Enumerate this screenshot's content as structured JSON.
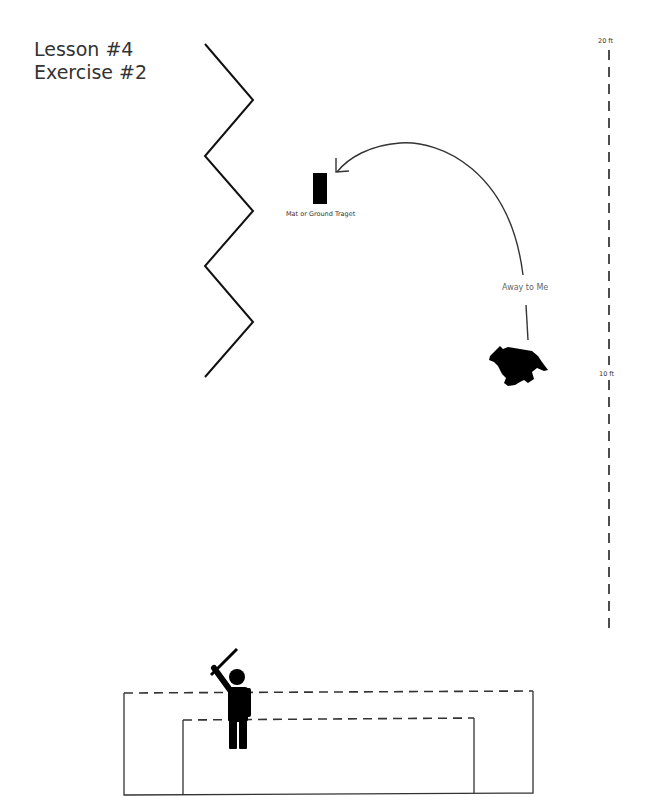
{
  "title": {
    "line1": "Lesson #4",
    "line2": "Exercise #2"
  },
  "scale": {
    "top_label": "20 ft",
    "mid_label": "10 ft"
  },
  "target": {
    "label": "Mat or Ground Traget",
    "icon": "mat-icon"
  },
  "command": {
    "label": "Away to Me",
    "icon": "curved-arrow-icon"
  },
  "dog": {
    "icon": "dog-silhouette-icon"
  },
  "handler": {
    "icon": "handler-with-stick-icon"
  },
  "fence": {
    "icon": "zigzag-fence-icon"
  },
  "pen": {
    "icon": "pen-enclosure-icon"
  },
  "colors": {
    "ink": "#000000",
    "line": "#333333",
    "text": "#333333"
  }
}
